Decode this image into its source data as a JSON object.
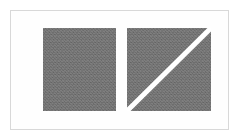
{
  "figure": {
    "background_color": "#ffffff",
    "frame": {
      "name": "figure-frame",
      "border_color": "#d8d8d8",
      "fill_color": "#fefefe",
      "x": 10,
      "y": 10,
      "width": 219,
      "height": 120
    },
    "shapes": [
      {
        "id": "square-plain",
        "kind": "square",
        "label": "plain gray square",
        "fill_color": "#6f6f6f",
        "texture": "noise",
        "x": 43,
        "y": 28,
        "width": 73,
        "height": 83,
        "has_diagonal": false
      },
      {
        "id": "square-diagonal",
        "kind": "square",
        "label": "gray square with white diagonal",
        "fill_color": "#6f6f6f",
        "texture": "noise",
        "x": 127,
        "y": 28,
        "width": 84,
        "height": 83,
        "has_diagonal": true,
        "diagonal": {
          "label": "diagonal line",
          "color": "#ffffff",
          "stroke_width": 4,
          "from": "bottom-left",
          "to": "top-right"
        }
      }
    ],
    "caption": ""
  }
}
